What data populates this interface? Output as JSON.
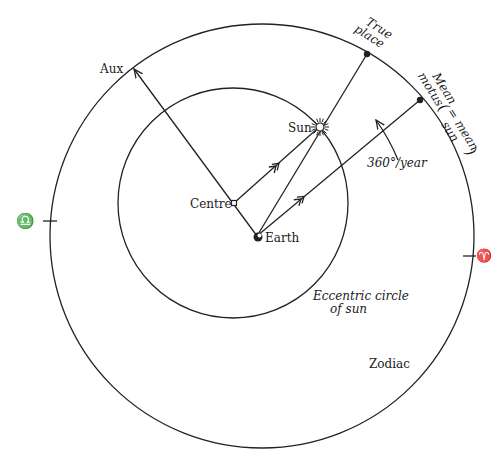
{
  "diagram": {
    "circles": {
      "zodiac": {
        "cx": 262,
        "cy": 236,
        "r": 212,
        "label": "Zodiac"
      },
      "eccentric": {
        "cx": 233,
        "cy": 203,
        "r": 115,
        "label_line1": "Eccentric circle",
        "label_line2": "of sun"
      }
    },
    "points": {
      "centre": {
        "x": 234,
        "y": 203,
        "label": "Centre"
      },
      "earth": {
        "x": 257,
        "y": 236,
        "label": "Earth"
      },
      "sun": {
        "x": 320,
        "y": 127,
        "label": "Sun"
      },
      "aux": {
        "x": 133,
        "y": 68,
        "label": "Aux"
      },
      "true_place": {
        "x": 367,
        "y": 54,
        "label_line1": "True",
        "label_line2": "place"
      },
      "mean_motus": {
        "x": 420,
        "y": 100,
        "label_line1": "Mean",
        "label_line2": "motus",
        "paren_line1": "= mean",
        "paren_line2": "sun"
      }
    },
    "annotations": {
      "rate": "360°/year"
    },
    "zodiac_signs": {
      "libra": {
        "symbol": "♎",
        "name": "Libra"
      },
      "aries": {
        "symbol": "♈",
        "name": "Aries"
      }
    }
  }
}
